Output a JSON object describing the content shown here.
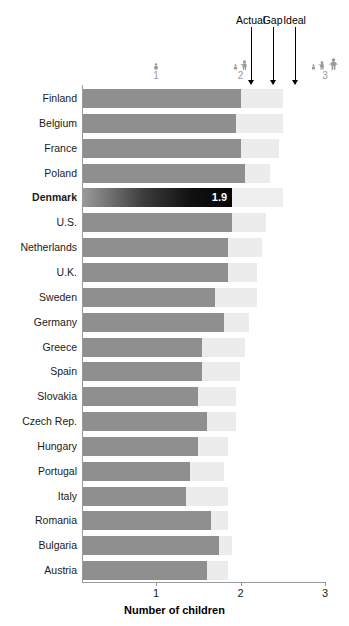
{
  "annotations": [
    {
      "label": "Actual",
      "x_value": 2.12
    },
    {
      "label": "Gap",
      "x_value": 2.38
    },
    {
      "label": "Ideal",
      "x_value": 2.64
    }
  ],
  "icon_legend": [
    {
      "count": "1",
      "figures": 1,
      "x_value": 1.0
    },
    {
      "count": "2",
      "figures": 2,
      "x_value": 2.0
    },
    {
      "count": "3",
      "figures": 3,
      "x_value": 3.0
    }
  ],
  "colors": {
    "actual": "#8f8f8f",
    "gap": "#ececec",
    "highlight": "#111111",
    "highlight_text": "#ffffff",
    "axis": "#9a9a9a",
    "icon": "#9a9a9a"
  },
  "highlight_country": "Denmark",
  "highlight_value_label": "1.9",
  "chart_data": {
    "type": "bar",
    "title": "",
    "subtitle": "",
    "xlabel": "Number of children",
    "ylabel": "",
    "xlim": [
      0,
      3
    ],
    "xticks": [
      1,
      2,
      3
    ],
    "xticklabels": [
      "1",
      "2",
      "3"
    ],
    "grid": false,
    "orientation": "horizontal",
    "stacked": true,
    "legend": [
      "Actual",
      "Gap",
      "Ideal"
    ],
    "legend_position": "top",
    "categories": [
      "Finland",
      "Belgium",
      "France",
      "Poland",
      "Denmark",
      "U.S.",
      "Netherlands",
      "U.K.",
      "Sweden",
      "Germany",
      "Greece",
      "Spain",
      "Slovakia",
      "Czech Rep.",
      "Hungary",
      "Portugal",
      "Italy",
      "Romania",
      "Bulgaria",
      "Austria"
    ],
    "series": [
      {
        "name": "Actual",
        "values": [
          2.0,
          1.95,
          2.0,
          2.05,
          1.9,
          1.9,
          1.85,
          1.85,
          1.7,
          1.8,
          1.55,
          1.55,
          1.5,
          1.6,
          1.5,
          1.4,
          1.35,
          1.65,
          1.75,
          1.6
        ]
      },
      {
        "name": "Gap",
        "values": [
          0.5,
          0.55,
          0.45,
          0.3,
          0.6,
          0.4,
          0.4,
          0.35,
          0.5,
          0.3,
          0.5,
          0.45,
          0.45,
          0.35,
          0.35,
          0.4,
          0.5,
          0.2,
          0.15,
          0.25
        ]
      }
    ],
    "ideal_values": [
      2.5,
      2.5,
      2.45,
      2.35,
      2.5,
      2.3,
      2.25,
      2.2,
      2.2,
      2.1,
      2.05,
      2.0,
      1.95,
      1.95,
      1.85,
      1.8,
      1.85,
      1.85,
      1.9,
      1.85
    ],
    "data_labels": {
      "Denmark": "1.9"
    }
  }
}
